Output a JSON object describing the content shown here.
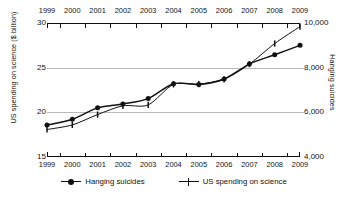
{
  "chart_data": {
    "type": "line",
    "title": "",
    "subtitle": "",
    "xlabel": "",
    "ylabel": "US spending on science ($ billion)",
    "ylabel_right": "Hanging suicides",
    "grid": true,
    "legend_position": "bottom",
    "x": [
      1999,
      2000,
      2001,
      2002,
      2003,
      2004,
      2005,
      2006,
      2007,
      2008,
      2009
    ],
    "categories": [
      "1999",
      "2000",
      "2001",
      "2002",
      "2003",
      "2004",
      "2005",
      "2006",
      "2007",
      "2008",
      "2009"
    ],
    "xlim": [
      1999,
      2009
    ],
    "ylim": [
      15,
      30
    ],
    "ylim_right": [
      4000,
      10000
    ],
    "yticks": [
      15,
      20,
      25,
      30
    ],
    "ytick_labels": [
      "15",
      "20",
      "25",
      "30"
    ],
    "yticks_right": [
      4000,
      6000,
      8000,
      10000
    ],
    "ytick_labels_right": [
      "4,000",
      "6,000",
      "8,000",
      "10,000"
    ],
    "xtick_labels_top": [
      "1999",
      "2000",
      "2001",
      "2002",
      "2003",
      "2004",
      "2005",
      "2006",
      "2007",
      "2008",
      "2009"
    ],
    "xtick_labels_bottom": [
      "1999",
      "2000",
      "2001",
      "2002",
      "2003",
      "2004",
      "2005",
      "2006",
      "2007",
      "2008",
      "2009"
    ],
    "series": [
      {
        "name": "Hanging suicides",
        "axis": "right",
        "marker": "filled-circle",
        "color": "#111111",
        "values_right_axis": [
          5427,
          5688,
          6198,
          6462,
          6635,
          7336,
          7248,
          7491,
          8161,
          8578,
          9000
        ],
        "values": [
          18.57,
          19.22,
          20.5,
          20.93,
          21.54,
          23.21,
          23.12,
          23.73,
          25.4,
          26.45,
          27.5
        ]
      },
      {
        "name": "US spending on science",
        "axis": "left",
        "marker": "plus",
        "color": "#111111",
        "values": [
          18.08,
          18.59,
          19.75,
          20.73,
          20.83,
          23.13,
          23.16,
          23.7,
          25.4,
          27.7,
          29.6
        ]
      }
    ],
    "legend": [
      {
        "label": "Hanging suicides",
        "marker": "filled-circle"
      },
      {
        "label": "US spending on science",
        "marker": "plus"
      }
    ]
  }
}
